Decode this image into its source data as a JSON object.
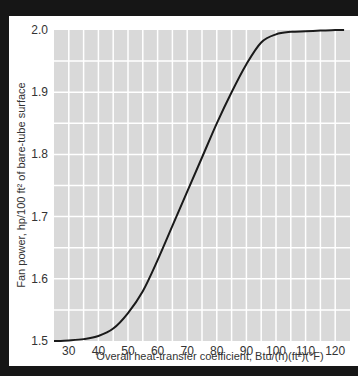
{
  "chart_data": {
    "type": "line",
    "title": "",
    "xlabel": "Overall heat-transfer coefficient, Btu/(h)(ft²)(°F)",
    "ylabel": "Fan power, hp/100 ft² of bare-tube surface",
    "xlim": [
      25,
      125
    ],
    "ylim": [
      1.5,
      2.0
    ],
    "x_ticks": [
      30,
      40,
      50,
      60,
      70,
      80,
      90,
      100,
      110,
      120
    ],
    "y_ticks": [
      1.5,
      1.6,
      1.7,
      1.8,
      1.9,
      2.0
    ],
    "x_tick_labels": [
      "30",
      "40",
      "50",
      "60",
      "70",
      "80",
      "90",
      "100",
      "110",
      "120"
    ],
    "y_tick_labels": [
      "1.5",
      "1.6",
      "1.7",
      "1.8",
      "1.9",
      "2.0"
    ],
    "grid": true,
    "grid_minor_x_step": 5,
    "grid_minor_y_step": 0.05,
    "legend": null,
    "series": [
      {
        "name": "Fan power",
        "x": [
          25,
          30,
          35,
          40,
          45,
          50,
          55,
          60,
          65,
          70,
          75,
          80,
          85,
          90,
          95,
          100,
          105,
          110,
          115,
          120,
          123
        ],
        "y": [
          1.5,
          1.501,
          1.503,
          1.508,
          1.52,
          1.545,
          1.58,
          1.63,
          1.685,
          1.74,
          1.795,
          1.85,
          1.9,
          1.945,
          1.98,
          1.993,
          1.997,
          1.998,
          1.999,
          2.0,
          2.0
        ]
      }
    ],
    "colors": {
      "background": "#d9d9d9",
      "grid": "#ffffff",
      "line": "#1a1a1a",
      "frame": "#161616"
    }
  }
}
